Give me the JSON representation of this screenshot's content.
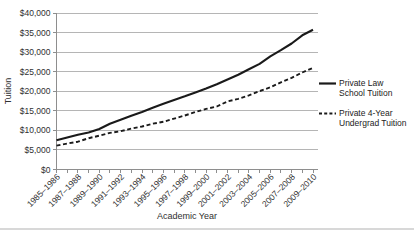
{
  "chart_data": {
    "type": "line",
    "title": "",
    "xlabel": "Academic Year",
    "ylabel": "Tuition",
    "ylim": [
      0,
      40000
    ],
    "ytick_step": 5000,
    "ytick_labels": [
      "$0",
      "$5,000",
      "$10,000",
      "$15,000",
      "$20,000",
      "$25,000",
      "$30,000",
      "$35,000",
      "$40,000"
    ],
    "categories": [
      "1985–1986",
      "1986–1987",
      "1987–1988",
      "1988–1989",
      "1989–1990",
      "1990–1991",
      "1991–1992",
      "1992–1993",
      "1993–1994",
      "1994–1995",
      "1995–1996",
      "1996–1997",
      "1997–1998",
      "1998–1999",
      "1999–2000",
      "2000–2001",
      "2001–2002",
      "2002–2003",
      "2003–2004",
      "2004–2005",
      "2005–2006",
      "2006–2007",
      "2007–2008",
      "2008–2009",
      "2009–2010"
    ],
    "xtick_label_every": 2,
    "grid": "horizontal",
    "legend_position": "right",
    "series": [
      {
        "name": "Private Law School Tuition",
        "legend_lines": [
          "Private Law",
          "School Tuition"
        ],
        "line_style": "solid",
        "color": "#1a1a1a",
        "values": [
          7500,
          8200,
          8900,
          9450,
          10350,
          11700,
          12700,
          13750,
          14700,
          15800,
          16800,
          17800,
          18700,
          19700,
          20700,
          21800,
          23000,
          24200,
          25600,
          27000,
          28900,
          30500,
          32200,
          34300,
          35700
        ]
      },
      {
        "name": "Private 4-Year Undergrad Tuition",
        "legend_lines": [
          "Private 4-Year",
          "Undergrad Tuition"
        ],
        "line_style": "dashed",
        "color": "#1a1a1a",
        "values": [
          6100,
          6650,
          7100,
          8000,
          8650,
          9350,
          9800,
          10450,
          11000,
          11700,
          12200,
          13000,
          13800,
          14700,
          15500,
          16100,
          17400,
          18050,
          18950,
          20050,
          21000,
          22300,
          23400,
          24800,
          26000
        ]
      }
    ],
    "colors": {
      "text": "#303030",
      "gridline": "#b5b5b5",
      "axis": "#8e8e8e",
      "series_line": "#1a1a1a"
    }
  }
}
